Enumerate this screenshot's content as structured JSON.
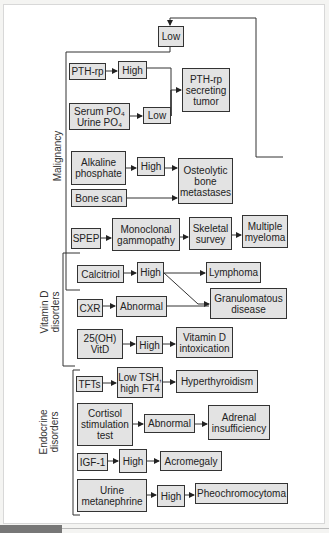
{
  "groups": {
    "malignancy": "Malignancy",
    "vitamin_d": "Vitamin D\ndisorders",
    "endocrine": "Endocrine\ndisorders"
  },
  "nodes": {
    "low_top": "Low",
    "pthrp": "PTH-rp",
    "high_pthrp": "High",
    "pthrp_tumor": "PTH-rp\nsecreting\ntumor",
    "po4_serum": "Serum PO₄",
    "po4_urine": "Urine PO₄",
    "low_po4": "Low",
    "alk_phos": "Alkaline\nphosphate",
    "high_alk": "High",
    "osteolytic": "Osteolytic\nbone\nmetastases",
    "bone_scan": "Bone scan",
    "spep": "SPEP",
    "monoclonal": "Monoclonal\ngammopathy",
    "skeletal": "Skeletal\nsurvey",
    "myeloma": "Multiple\nmyeloma",
    "calcitriol": "Calcitriol",
    "high_calcitriol": "High",
    "lymphoma": "Lymphoma",
    "cxr": "CXR",
    "abnormal_cxr": "Abnormal",
    "granulomatous": "Granulomatous\ndisease",
    "vitd25": "25(OH)\nVitD",
    "high_vitd": "High",
    "vitd_intox": "Vitamin D\nintoxication",
    "tfts": "TFTs",
    "low_tsh": "Low TSH,\nhigh FT4",
    "hyperthyroid": "Hyperthyroidism",
    "cortisol": "Cortisol\nstimulation\ntest",
    "abnormal_cort": "Abnormal",
    "adrenal": "Adrenal\ninsufficiency",
    "igf1": "IGF-1",
    "high_igf": "High",
    "acromegaly": "Acromegaly",
    "urine_met": "Urine\nmetanephrine",
    "high_met": "High",
    "pheo": "Pheochromocytoma"
  },
  "colors": {
    "box_fill": "#e3e3e3",
    "line": "#333333",
    "page": "#ffffff"
  }
}
